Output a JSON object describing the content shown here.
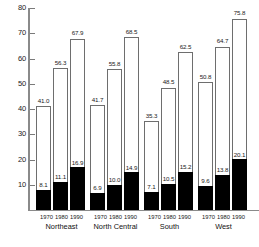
{
  "chart_data": {
    "type": "bar",
    "title": "",
    "subtitle": "",
    "xlabel": "",
    "ylabel": "",
    "ylim": [
      0,
      80
    ],
    "y_ticks": [
      10,
      20,
      30,
      40,
      50,
      60,
      70,
      80
    ],
    "grid": false,
    "legend_position": "none",
    "categories": [
      "Northeast",
      "North Central",
      "South",
      "West"
    ],
    "sub_categories": [
      "1970",
      "1980",
      "1990"
    ],
    "series": [
      {
        "name": "outer",
        "style": "hollow",
        "values": [
          [
            41.0,
            56.3,
            67.9
          ],
          [
            41.7,
            55.8,
            68.5
          ],
          [
            35.3,
            48.5,
            62.5
          ],
          [
            50.8,
            64.7,
            75.8
          ]
        ]
      },
      {
        "name": "inner",
        "style": "filled",
        "values": [
          [
            8.1,
            11.1,
            16.9
          ],
          [
            6.9,
            10.0,
            14.9
          ],
          [
            7.1,
            10.5,
            15.2
          ],
          [
            9.6,
            13.8,
            20.1
          ]
        ]
      }
    ],
    "groups": [
      {
        "label": "Northeast",
        "bars": [
          {
            "year": "1970",
            "outer": "41.0",
            "inner": "8.1"
          },
          {
            "year": "1980",
            "outer": "56.3",
            "inner": "11.1"
          },
          {
            "year": "1990",
            "outer": "67.9",
            "inner": "16.9"
          }
        ]
      },
      {
        "label": "North Central",
        "bars": [
          {
            "year": "1970",
            "outer": "41.7",
            "inner": "6.9"
          },
          {
            "year": "1980",
            "outer": "55.8",
            "inner": "10.0"
          },
          {
            "year": "1990",
            "outer": "68.5",
            "inner": "14.9"
          }
        ]
      },
      {
        "label": "South",
        "bars": [
          {
            "year": "1970",
            "outer": "35.3",
            "inner": "7.1"
          },
          {
            "year": "1980",
            "outer": "48.5",
            "inner": "10.5"
          },
          {
            "year": "1990",
            "outer": "62.5",
            "inner": "15.2"
          }
        ]
      },
      {
        "label": "West",
        "bars": [
          {
            "year": "1970",
            "outer": "50.8",
            "inner": "9.6"
          },
          {
            "year": "1980",
            "outer": "64.7",
            "inner": "13.8"
          },
          {
            "year": "1990",
            "outer": "75.8",
            "inner": "20.1"
          }
        ]
      }
    ],
    "colors": {
      "outer_fill": "#ffffff",
      "outer_stroke": "#6e6e6e",
      "inner_fill": "#000000",
      "axis": "#8a8a8a",
      "text": "#1a1a1a",
      "background": "#ffffff"
    }
  }
}
